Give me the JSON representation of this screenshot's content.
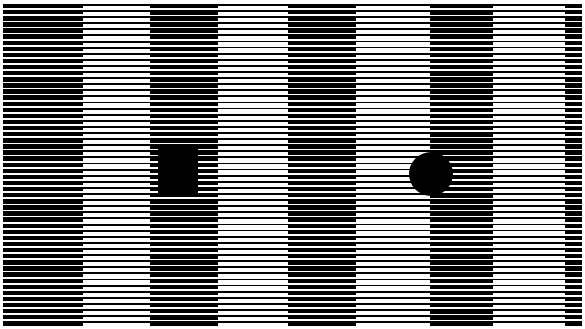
{
  "image": {
    "title": "Horizontal stripe grating illusion plate",
    "width": 585,
    "height": 329,
    "background_color": "#ffffff",
    "ink_color": "#000000"
  },
  "plate": {
    "x": 3,
    "y": 4,
    "width": 579,
    "height": 323,
    "stripe_orientation": "horizontal",
    "stripe_period_px": 6.1,
    "note": "Horizontal black stripes of constant period; vertical bands change the black line thickness (duty cycle), producing alternating dark and light vertical columns."
  },
  "bands": [
    {
      "name": "band-1-dark",
      "x": 0,
      "width": 80,
      "tone": "dark",
      "black_thickness_px": 4.3
    },
    {
      "name": "band-2-light",
      "x": 80,
      "width": 67,
      "tone": "light",
      "black_thickness_px": 1.9
    },
    {
      "name": "band-3-dark",
      "x": 147,
      "width": 68,
      "tone": "dark",
      "black_thickness_px": 4.4
    },
    {
      "name": "band-4-light",
      "x": 215,
      "width": 70,
      "tone": "light",
      "black_thickness_px": 1.8
    },
    {
      "name": "band-5-dark",
      "x": 285,
      "width": 68,
      "tone": "dark",
      "black_thickness_px": 4.3
    },
    {
      "name": "band-6-light",
      "x": 353,
      "width": 74,
      "tone": "light",
      "black_thickness_px": 1.8
    },
    {
      "name": "band-7-dark",
      "x": 427,
      "width": 63,
      "tone": "dark",
      "black_thickness_px": 4.5
    },
    {
      "name": "band-8-light",
      "x": 490,
      "width": 72,
      "tone": "light",
      "black_thickness_px": 1.8
    },
    {
      "name": "band-9-dark",
      "x": 562,
      "width": 17,
      "tone": "dark",
      "black_thickness_px": 4.3
    }
  ],
  "shapes": [
    {
      "name": "black-square",
      "form": "square",
      "x": 158,
      "y": 147,
      "width": 40,
      "height": 49,
      "color": "#000000",
      "over_band": "band-3-dark"
    },
    {
      "name": "black-circle",
      "form": "circle",
      "x": 409,
      "y": 152,
      "width": 44,
      "height": 44,
      "color": "#000000",
      "over_band": "band-6-light"
    }
  ]
}
